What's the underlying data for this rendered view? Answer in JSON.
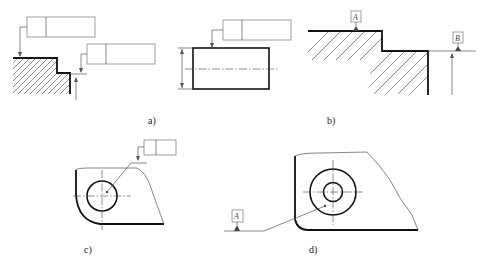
{
  "figure": {
    "panels": [
      {
        "id": "a",
        "caption": "a)",
        "description": "Step surface with two feature control frames pointing to surfaces"
      },
      {
        "id": "b",
        "caption": "b)",
        "description": "Stepped surface with datum features A and B"
      },
      {
        "id": "c",
        "caption": "c)",
        "description": "Plate with circular hole and feature control frame leader to hole axis"
      },
      {
        "id": "d",
        "caption": "d)",
        "description": "Plate with concentric circles and datum A leader to axis"
      }
    ],
    "datums": {
      "b_top": "A",
      "b_right": "B",
      "d_left": "A"
    }
  }
}
